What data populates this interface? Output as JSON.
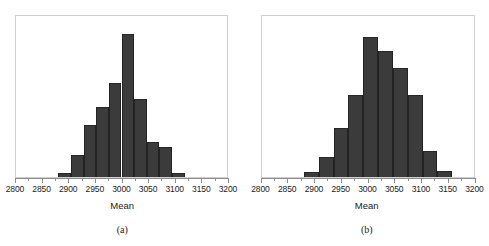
{
  "figure": {
    "axis_title": "Mean",
    "bar_color": "#3b3b3b",
    "bar_edge_color": "#232323",
    "frame_color": "#cfcfcf",
    "axis_color": "#8d8d8d"
  },
  "panels": [
    {
      "caption": "(a)",
      "axis_title": "Mean"
    },
    {
      "caption": "(b)",
      "axis_title": "Mean"
    }
  ],
  "chart_data": [
    {
      "type": "bar",
      "title": "",
      "subtitle": "",
      "panel": "(a)",
      "xlabel": "Mean",
      "ylabel": "",
      "xlim": [
        2800,
        3200
      ],
      "ylim": [
        0,
        165
      ],
      "grid": false,
      "legend": "none",
      "tick_labels": [
        "2800",
        "2850",
        "2900",
        "2950",
        "3000",
        "3050",
        "3100",
        "3150",
        "3200"
      ],
      "tick_values": [
        2800,
        2850,
        2900,
        2950,
        3000,
        3050,
        3100,
        3150,
        3200
      ],
      "minor_tick_values": [
        2825,
        2875,
        2925,
        2975,
        3025,
        3075,
        3125,
        3175
      ],
      "bin_edges": [
        2880,
        2904,
        2928,
        2952,
        2976,
        3000,
        3024,
        3048,
        3072,
        3096,
        3120
      ],
      "counts": [
        4,
        23,
        53,
        72,
        96,
        147,
        80,
        36,
        31,
        4
      ],
      "ymax": 165,
      "annotations": []
    },
    {
      "type": "bar",
      "title": "",
      "subtitle": "",
      "panel": "(b)",
      "xlabel": "Mean",
      "ylabel": "",
      "xlim": [
        2800,
        3200
      ],
      "ylim": [
        0,
        165
      ],
      "grid": false,
      "legend": "none",
      "tick_labels": [
        "2800",
        "2850",
        "2900",
        "2950",
        "3000",
        "3050",
        "3100",
        "3150",
        "3200"
      ],
      "tick_values": [
        2800,
        2850,
        2900,
        2950,
        3000,
        3050,
        3100,
        3150,
        3200
      ],
      "minor_tick_values": [
        2825,
        2875,
        2925,
        2975,
        3025,
        3075,
        3125,
        3175
      ],
      "bin_edges": [
        2880,
        2908,
        2936,
        2964,
        2992,
        3020,
        3048,
        3076,
        3104,
        3132,
        3160
      ],
      "counts": [
        5,
        21,
        50,
        84,
        143,
        129,
        112,
        84,
        27,
        6
      ],
      "ymax": 165,
      "annotations": []
    }
  ]
}
